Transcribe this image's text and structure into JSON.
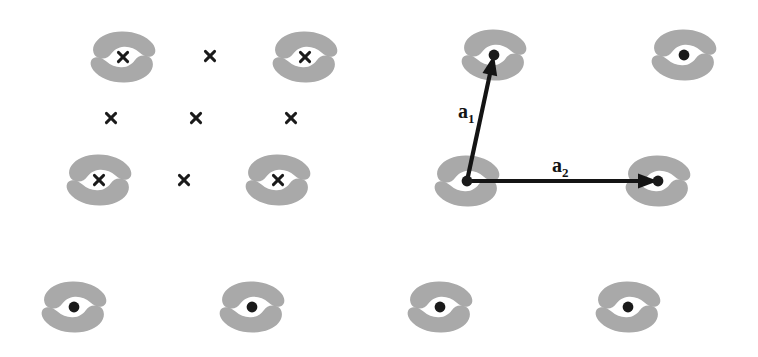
{
  "figure": {
    "background_color": "#ffffff",
    "width": 758,
    "height": 357,
    "motif_color": "#a9a9a9",
    "mark_color": "#1a1a1a",
    "vector_color": "#141414"
  },
  "labels": {
    "a1": {
      "base": "a",
      "sub": "1",
      "x": 458,
      "y": 118
    },
    "a2": {
      "base": "a",
      "sub": "2",
      "x": 552,
      "y": 172
    }
  },
  "vectors": [
    {
      "name": "a1",
      "from_x": 467,
      "from_y": 181,
      "to_x": 494,
      "to_y": 55,
      "label": "a1"
    },
    {
      "name": "a2",
      "from_x": 467,
      "from_y": 181,
      "to_x": 658,
      "to_y": 181,
      "label": "a2"
    }
  ],
  "motifs": [
    {
      "id": "motif-r1-c1",
      "x": 123,
      "y": 57,
      "marker": "cross"
    },
    {
      "id": "motif-r1-c2",
      "x": 305,
      "y": 57,
      "marker": "cross"
    },
    {
      "id": "motif-r1-c3",
      "x": 494,
      "y": 55,
      "marker": "dot"
    },
    {
      "id": "motif-r1-c4",
      "x": 684,
      "y": 55,
      "marker": "dot"
    },
    {
      "id": "motif-r2-c1",
      "x": 99,
      "y": 180,
      "marker": "cross"
    },
    {
      "id": "motif-r2-c2",
      "x": 278,
      "y": 180,
      "marker": "cross"
    },
    {
      "id": "motif-r2-c3",
      "x": 467,
      "y": 181,
      "marker": "dot"
    },
    {
      "id": "motif-r2-c4",
      "x": 658,
      "y": 181,
      "marker": "dot"
    },
    {
      "id": "motif-r3-c1",
      "x": 74,
      "y": 307,
      "marker": "dot"
    },
    {
      "id": "motif-r3-c2",
      "x": 252,
      "y": 307,
      "marker": "dot"
    },
    {
      "id": "motif-r3-c3",
      "x": 440,
      "y": 307,
      "marker": "dot"
    },
    {
      "id": "motif-r3-c4",
      "x": 628,
      "y": 307,
      "marker": "dot"
    }
  ],
  "lone_marks": [
    {
      "id": "cross-r1-mid",
      "x": 210,
      "y": 56,
      "marker": "cross"
    },
    {
      "id": "cross-r1b-left",
      "x": 111,
      "y": 118,
      "marker": "cross"
    },
    {
      "id": "cross-r1b-mid",
      "x": 196,
      "y": 118,
      "marker": "cross"
    },
    {
      "id": "cross-r1b-right",
      "x": 291,
      "y": 118,
      "marker": "cross"
    },
    {
      "id": "cross-r2-mid",
      "x": 184,
      "y": 180,
      "marker": "cross"
    }
  ],
  "chart_data": {
    "type": "scatter",
    "xlabel": "",
    "ylabel": "",
    "xlim": [
      0,
      758
    ],
    "ylim": [
      357,
      0
    ],
    "grid": false,
    "legend": null,
    "series": [
      {
        "name": "lattice points marked with cross (x)",
        "marker": "x",
        "x": [
          123,
          305,
          210,
          111,
          196,
          291,
          99,
          278,
          184
        ],
        "y": [
          57,
          57,
          56,
          118,
          118,
          118,
          180,
          180,
          180
        ]
      },
      {
        "name": "lattice points marked with filled dot",
        "marker": "o",
        "x": [
          494,
          684,
          467,
          658,
          74,
          252,
          440,
          628
        ],
        "y": [
          55,
          55,
          181,
          181,
          307,
          307,
          307,
          307
        ]
      },
      {
        "name": "motif (comma-shaped basis) centers",
        "marker": "motif",
        "x": [
          123,
          305,
          494,
          684,
          99,
          278,
          467,
          658,
          74,
          252,
          440,
          628
        ],
        "y": [
          57,
          57,
          55,
          55,
          180,
          180,
          181,
          181,
          307,
          307,
          307,
          307
        ]
      }
    ],
    "annotations": [
      {
        "text": "a1",
        "x": 458,
        "y": 118,
        "kind": "vector-label"
      },
      {
        "text": "a2",
        "x": 552,
        "y": 172,
        "kind": "vector-label"
      }
    ],
    "arrows": [
      {
        "label": "a1",
        "x0": 467,
        "y0": 181,
        "x1": 494,
        "y1": 55
      },
      {
        "label": "a2",
        "x0": 467,
        "y0": 181,
        "x1": 658,
        "y1": 181
      }
    ]
  }
}
